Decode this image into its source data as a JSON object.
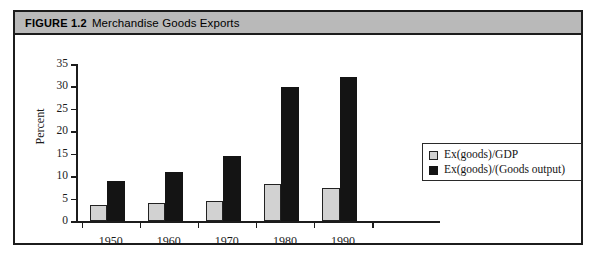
{
  "figure": {
    "label": "FIGURE 1.2",
    "title": "Merchandise Goods Exports"
  },
  "colors": {
    "frame_border": "#1c1c1c",
    "title_bar_bg": "#b9b9b9",
    "series_gdp": "#d2d2d2",
    "series_goods_output": "#141414",
    "axis": "#1c1c1c",
    "page_bg": "#ffffff"
  },
  "chart_data": {
    "type": "bar",
    "title": "Merchandise Goods Exports",
    "xlabel": "",
    "ylabel": "Percent",
    "categories": [
      "1950",
      "1960",
      "1970",
      "1980",
      "1990"
    ],
    "series": [
      {
        "name": "Ex(goods)/GDP",
        "color": "#d2d2d2",
        "values": [
          3.5,
          4.0,
          4.4,
          8.3,
          7.3
        ]
      },
      {
        "name": "Ex(goods)/(Goods output)",
        "color": "#141414",
        "values": [
          9.0,
          11.0,
          14.4,
          29.8,
          32.0
        ]
      }
    ],
    "ylim": [
      0,
      35
    ],
    "yticks": [
      0,
      5,
      10,
      15,
      20,
      25,
      30,
      35
    ],
    "ytick_labels": [
      "0",
      "5",
      "10",
      "15",
      "20",
      "25",
      "30",
      "35"
    ],
    "grid": false,
    "legend_position": "center-right",
    "legend_entries": [
      "Ex(goods)/GDP",
      "Ex(goods)/(Goods output)"
    ]
  }
}
